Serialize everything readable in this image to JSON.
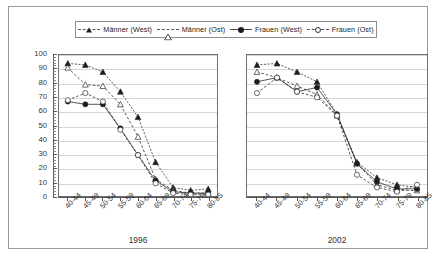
{
  "legend": {
    "items": [
      {
        "label": "Männer (West)",
        "marker": "filled-triangle",
        "line": "dashed",
        "color": "#1c1c1c"
      },
      {
        "label": "Männer (Ost)",
        "marker": "open-triangle",
        "line": "dashed",
        "color": "#333333"
      },
      {
        "label": "Frauen (West)",
        "marker": "filled-circle",
        "line": "solid",
        "color": "#1c1c1c"
      },
      {
        "label": "Frauen (Ost)",
        "marker": "open-circle",
        "line": "dashed",
        "color": "#333333"
      }
    ]
  },
  "yaxis": {
    "ticks": [
      "100",
      "90",
      "80",
      "70",
      "60",
      "50",
      "40",
      "30",
      "20",
      "10",
      "0"
    ],
    "min": 0,
    "max": 100,
    "step": 10
  },
  "chart_data": [
    {
      "type": "line",
      "title": "1996",
      "xlabel": "",
      "ylabel": "",
      "ylim": [
        0,
        100
      ],
      "grid": true,
      "legend_position": "top",
      "categories": [
        "40-44",
        "45-49",
        "50-54",
        "55-59",
        "60-64",
        "65-69",
        "70-74",
        "75-79",
        "80-85"
      ],
      "series": [
        {
          "name": "Männer (West)",
          "values": [
            94,
            93,
            88,
            74,
            56,
            24,
            6,
            4,
            5
          ]
        },
        {
          "name": "Männer (Ost)",
          "values": [
            91,
            79,
            78,
            65,
            42,
            12,
            4,
            2,
            2
          ]
        },
        {
          "name": "Frauen (West)",
          "values": [
            67,
            65,
            65,
            48,
            29,
            11,
            3,
            2,
            2
          ]
        },
        {
          "name": "Frauen (Ost)",
          "values": [
            68,
            73,
            67,
            47,
            29,
            9,
            2,
            1,
            1
          ]
        }
      ]
    },
    {
      "type": "line",
      "title": "2002",
      "xlabel": "",
      "ylabel": "",
      "ylim": [
        0,
        100
      ],
      "grid": true,
      "legend_position": "top",
      "categories": [
        "40-44",
        "45-49",
        "50-54",
        "55-59",
        "60-64",
        "65-69",
        "70-74",
        "75-79",
        "80-85"
      ],
      "series": [
        {
          "name": "Männer (West)",
          "values": [
            93,
            94,
            88,
            81,
            58,
            24,
            13,
            8,
            6
          ]
        },
        {
          "name": "Männer (Ost)",
          "values": [
            88,
            84,
            78,
            72,
            57,
            23,
            8,
            4,
            4
          ]
        },
        {
          "name": "Frauen (West)",
          "values": [
            81,
            84,
            74,
            77,
            58,
            23,
            10,
            5,
            5
          ]
        },
        {
          "name": "Frauen (Ost)",
          "values": [
            73,
            84,
            74,
            70,
            57,
            15,
            6,
            3,
            8
          ]
        }
      ]
    }
  ]
}
